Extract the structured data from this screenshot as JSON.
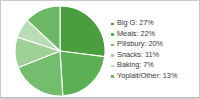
{
  "card": {
    "background_color": "#ffffff",
    "border_color": "#c9c9c9"
  },
  "chart_data": {
    "type": "pie",
    "title": "",
    "subtitle": "",
    "xlabel": "",
    "ylabel": "",
    "legend_position": "right",
    "start_angle_oclock": 12,
    "direction": "clockwise",
    "categories": [
      "Big G",
      "Meals",
      "Pillsbury",
      "Snacks",
      "Baking",
      "Yoplait/Other"
    ],
    "values": [
      27,
      22,
      20,
      11,
      7,
      13
    ],
    "unit": "%",
    "colors": [
      "#4a9e3f",
      "#5cb054",
      "#74bd6e",
      "#9ed097",
      "#b8dcb4",
      "#6cb866"
    ],
    "slice_separator_color": "#ffffff",
    "slices": [
      {
        "label": "Big G",
        "value": 27,
        "color": "#4a9e3f",
        "legend_label": "Big G: 27%"
      },
      {
        "label": "Meals",
        "value": 22,
        "color": "#5cb054",
        "legend_label": "Meals: 22%"
      },
      {
        "label": "Pillsbury",
        "value": 20,
        "color": "#74bd6e",
        "legend_label": "Pillsbury: 20%"
      },
      {
        "label": "Snacks",
        "value": 11,
        "color": "#9ed097",
        "legend_label": "Snacks: 11%"
      },
      {
        "label": "Baking",
        "value": 7,
        "color": "#b8dcb4",
        "legend_label": "Baking: 7%"
      },
      {
        "label": "Yoplait/Other",
        "value": 13,
        "color": "#6cb866",
        "legend_label": "Yoplait/Other: 13%"
      }
    ]
  },
  "legend": {
    "items": [
      {
        "label": "Big G: 27%",
        "color": "#4a9e3f"
      },
      {
        "label": "Meals: 22%",
        "color": "#5cb054"
      },
      {
        "label": "Pillsbury: 20%",
        "color": "#74bd6e"
      },
      {
        "label": "Snacks: 11%",
        "color": "#9ed097"
      },
      {
        "label": "Baking: 7%",
        "color": "#b8dcb4"
      },
      {
        "label": "Yoplait/Other: 13%",
        "color": "#6cb866"
      }
    ],
    "text_color": "#3a3a3a"
  }
}
